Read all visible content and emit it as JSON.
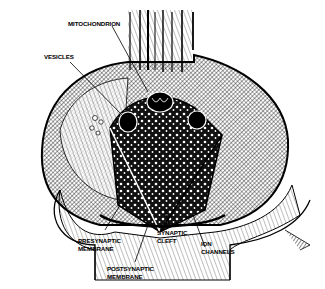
{
  "figure": {
    "colors": {
      "ink": "#000000",
      "paper": "#ffffff"
    },
    "labels": {
      "mitochondrion": {
        "lines": [
          "MITOCHONDRION"
        ]
      },
      "vesicles": {
        "lines": [
          "VESICLES"
        ]
      },
      "presynaptic_membrane": {
        "lines": [
          "PRESYNAPTIC",
          "MEMBRANE"
        ]
      },
      "synaptic_cleft": {
        "lines": [
          "SYNAPTIC",
          "CLEFT"
        ]
      },
      "ion_channels": {
        "lines": [
          "ION",
          "CHANNELS"
        ]
      },
      "postsynaptic_membrane": {
        "lines": [
          "POSTSYNAPTIC",
          "MEMBRANE"
        ]
      }
    }
  }
}
